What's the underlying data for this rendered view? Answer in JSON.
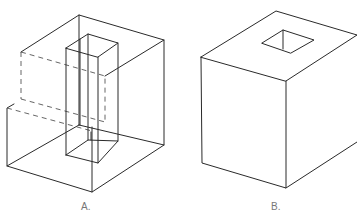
{
  "figures": [
    {
      "id": "A",
      "label": "A.",
      "description": "Wireframe cube with stepped notch and vertical rectangular pillar, hidden edges dashed"
    },
    {
      "id": "B",
      "label": "B.",
      "description": "Solid cube with square hole on top face"
    }
  ],
  "colors": {
    "line": "#2a2a2a",
    "hidden_line": "#555555",
    "label": "#777777",
    "background": "#ffffff"
  }
}
